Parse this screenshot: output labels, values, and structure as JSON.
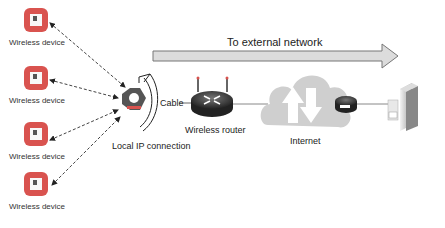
{
  "diagram": {
    "banner": {
      "label": "To external network"
    },
    "devices": [
      {
        "label": "Wireless device"
      },
      {
        "label": "Wireless device"
      },
      {
        "label": "Wireless device"
      },
      {
        "label": "Wireless device"
      }
    ],
    "hub": {
      "label": "Local IP connection"
    },
    "cable": {
      "label": "Cable"
    },
    "router": {
      "label": "Wireless router"
    },
    "internet": {
      "label": "Internet"
    },
    "colors": {
      "device_red": "#d9534f",
      "hub_dark": "#555555",
      "arrow_fill": "#d8d8d8",
      "cloud": "#cfcfcf",
      "line": "#666666"
    }
  }
}
